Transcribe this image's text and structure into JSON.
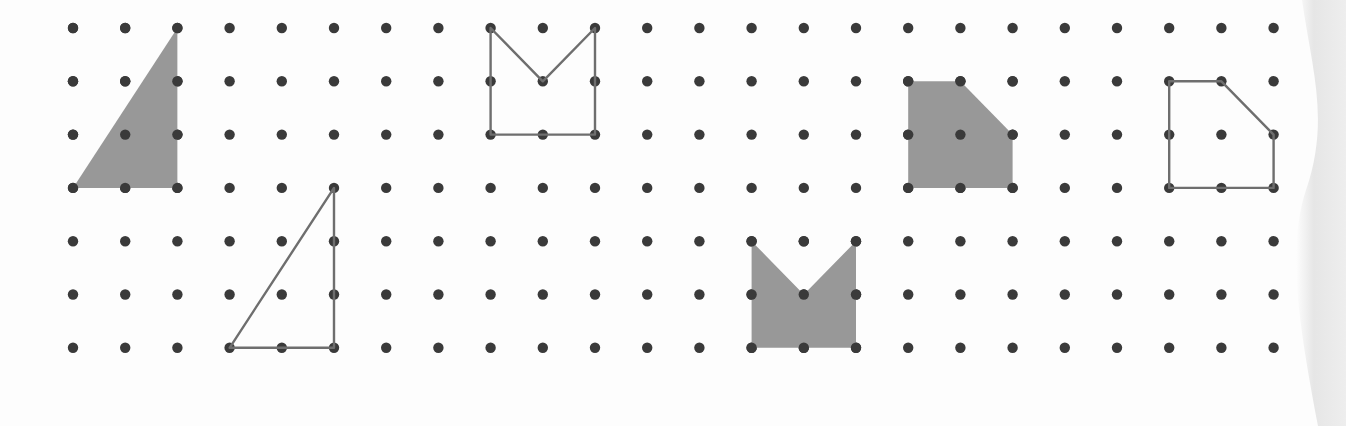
{
  "worksheet": {
    "title": "Geoboard dot-grid shapes worksheet",
    "description": "Seven-row by twenty-four-column square dot lattice with six plotted polygons: three shaded (solid gray fill) and three outlined (gray stroke only), arranged as matched shaded/outline pairs.",
    "background_color": "#fdfdfd",
    "page_edge_shadow_color": "#e2e2e2"
  },
  "grid": {
    "label": "dot lattice",
    "columns": 24,
    "rows": 7,
    "origin_x": 73,
    "origin_y": 28,
    "spacing_x": 52.2,
    "spacing_y": 53.3,
    "dot_radius": 5.2,
    "dot_color": "#3a3a3a"
  },
  "style": {
    "fill_color": "#989898",
    "stroke_color": "#6e6e6e",
    "stroke_width": 2.4
  },
  "chart_data": {
    "type": "scatter",
    "xlabel": "column index",
    "ylabel": "row index",
    "xlim": [
      0,
      23
    ],
    "ylim": [
      0,
      6
    ],
    "grid": true,
    "legend": [
      "shaded polygon",
      "outlined polygon"
    ],
    "shapes": [
      {
        "id": "shape-1",
        "name": "shaded-right-triangle",
        "kind": "triangle",
        "style": "filled",
        "vertices": [
          [
            0,
            3
          ],
          [
            2,
            0
          ],
          [
            2,
            3
          ]
        ],
        "vertex_count": 3
      },
      {
        "id": "shape-2",
        "name": "outlined-right-triangle",
        "kind": "triangle",
        "style": "outlined",
        "vertices": [
          [
            3,
            6
          ],
          [
            5,
            3
          ],
          [
            5,
            6
          ]
        ],
        "vertex_count": 3
      },
      {
        "id": "shape-3",
        "name": "outlined-chevron-crown",
        "kind": "concave-pentagon",
        "style": "outlined",
        "vertices": [
          [
            8,
            0
          ],
          [
            9,
            1
          ],
          [
            10,
            0
          ],
          [
            10,
            2
          ],
          [
            8,
            2
          ]
        ],
        "vertex_count": 5
      },
      {
        "id": "shape-4",
        "name": "shaded-chevron-crown",
        "kind": "concave-pentagon",
        "style": "filled",
        "vertices": [
          [
            13,
            4
          ],
          [
            14,
            5
          ],
          [
            15,
            4
          ],
          [
            15,
            6
          ],
          [
            13,
            6
          ]
        ],
        "vertex_count": 5
      },
      {
        "id": "shape-5",
        "name": "shaded-cut-corner-pentagon",
        "kind": "convex-pentagon",
        "style": "filled",
        "vertices": [
          [
            16,
            1
          ],
          [
            17,
            1
          ],
          [
            18,
            2
          ],
          [
            18,
            3
          ],
          [
            16,
            3
          ]
        ],
        "vertex_count": 5
      },
      {
        "id": "shape-6",
        "name": "outlined-cut-corner-pentagon",
        "kind": "convex-pentagon",
        "style": "outlined",
        "vertices": [
          [
            21,
            1
          ],
          [
            22,
            1
          ],
          [
            23,
            2
          ],
          [
            23,
            3
          ],
          [
            21,
            3
          ]
        ],
        "vertex_count": 5
      }
    ]
  }
}
